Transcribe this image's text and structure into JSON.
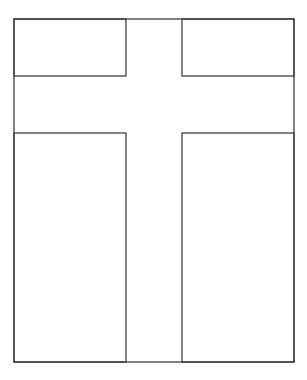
{
  "figure": {
    "title": "",
    "stroke_color": "#333333",
    "background": "#ffffff",
    "outer": {
      "x1": 14,
      "y1": 19,
      "x2": 294,
      "y2": 362
    },
    "cross": {
      "vertical_band": {
        "x_left": 126,
        "x_right": 182
      },
      "horizontal_band": {
        "y_top": 76,
        "y_bottom": 133
      }
    },
    "panels": [
      {
        "name": "top-left",
        "x": 14,
        "y": 19,
        "w": 112,
        "h": 57
      },
      {
        "name": "top-right",
        "x": 182,
        "y": 19,
        "w": 112,
        "h": 57
      },
      {
        "name": "bottom-left",
        "x": 14,
        "y": 133,
        "w": 112,
        "h": 229
      },
      {
        "name": "bottom-right",
        "x": 182,
        "y": 133,
        "w": 112,
        "h": 229
      }
    ]
  }
}
